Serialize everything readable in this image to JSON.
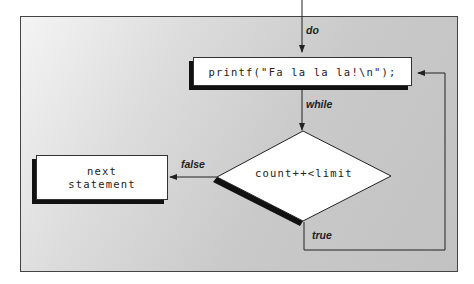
{
  "diagram": {
    "type": "flowchart",
    "nodes": {
      "statement": {
        "label": "printf(\"Fa la la la!\\n\");",
        "shape": "rectangle"
      },
      "condition": {
        "label": "count++<limit",
        "shape": "diamond"
      },
      "next": {
        "line1": "next",
        "line2": "statement",
        "shape": "rectangle"
      }
    },
    "edges": {
      "entry": {
        "label": "do"
      },
      "to_condition": {
        "label": "while"
      },
      "false_branch": {
        "label": "false"
      },
      "true_branch": {
        "label": "true"
      }
    }
  }
}
